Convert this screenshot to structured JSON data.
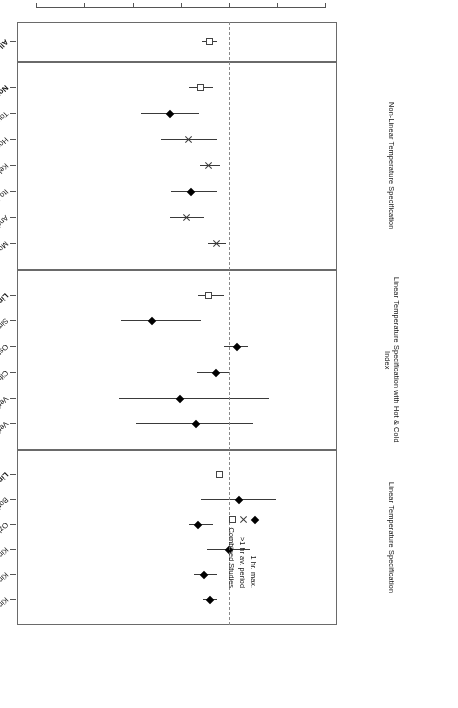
{
  "chart_data": {
    "type": "scatter",
    "plot_kind": "forest-plot",
    "title": "",
    "xlabel": "Relative Risk",
    "ylabel": "",
    "xlim": [
      0.78,
      1.44
    ],
    "xticks": [
      0.8,
      0.9,
      1.0,
      1.1,
      1.2,
      1.3,
      1.4
    ],
    "xticklabels": [
      "0.8",
      "0.9",
      "1.0",
      "1.1",
      "1.2",
      "1.3",
      "1.4"
    ],
    "null_reference": 1.0,
    "grid": false,
    "rotated_180": true,
    "legend": {
      "position": "lower-right-inside",
      "entries": [
        {
          "label": "1 hr. max.",
          "symbol": "filled-diamond"
        },
        {
          "label": ">1 hr av. period",
          "symbol": "cross"
        },
        {
          "label": "Combined Studies",
          "symbol": "open-square"
        }
      ]
    },
    "panels": [
      {
        "name": "overall",
        "label": "",
        "rows": [
          {
            "study": "All Studies Combined",
            "bold": true,
            "symbol": "open-square",
            "rr": 1.043,
            "lo": 1.028,
            "hi": 1.058
          }
        ]
      },
      {
        "name": "non-linear-temperature",
        "label": "Non-Linear Temperature Specification",
        "rows": [
          {
            "study": "Non-Linear Temperature Models Combined",
            "bold": true,
            "symbol": "open-square",
            "rr": 1.062,
            "lo": 1.036,
            "hi": 1.085
          },
          {
            "study": "Touloumi et al., 1997",
            "bold": false,
            "symbol": "filled-diamond",
            "rr": 1.124,
            "lo": 1.064,
            "hi": 1.184
          },
          {
            "study": "Hoek et al., 1997",
            "bold": false,
            "symbol": "cross",
            "rr": 1.086,
            "lo": 1.027,
            "hi": 1.144
          },
          {
            "study": "Kelsall et al., 1997",
            "bold": false,
            "symbol": "cross",
            "rr": 1.044,
            "lo": 1.02,
            "hi": 1.062
          },
          {
            "study": "Ito & Thurston, 1996",
            "bold": false,
            "symbol": "filled-diamond",
            "rr": 1.08,
            "lo": 1.026,
            "hi": 1.122
          },
          {
            "study": "Anderson et al., 1996",
            "bold": false,
            "symbol": "cross",
            "rr": 1.09,
            "lo": 1.054,
            "hi": 1.124
          },
          {
            "study": "Moolgavkar et al., 1995",
            "bold": false,
            "symbol": "cross",
            "rr": 1.028,
            "lo": 1.008,
            "hi": 1.046
          }
        ]
      },
      {
        "name": "linear-temperature-hot-cold",
        "label": "Linear Temperature Specification with Hot & Cold Index",
        "rows": [
          {
            "study": "Linear Temperature plus Index Models Combined",
            "bold": true,
            "symbol": "open-square",
            "rr": 1.044,
            "lo": 1.012,
            "hi": 1.066
          },
          {
            "study": "Simpson et al., 1997",
            "bold": false,
            "symbol": "filled-diamond",
            "rr": 1.162,
            "lo": 1.06,
            "hi": 1.226
          },
          {
            "study": "Ostro et al., 1996",
            "bold": false,
            "symbol": "filled-diamond",
            "rr": 0.986,
            "lo": 0.962,
            "hi": 1.012
          },
          {
            "study": "Cifuentes & Lave, 1997",
            "bold": false,
            "symbol": "filled-diamond",
            "rr": 1.03,
            "lo": 1.0,
            "hi": 1.068
          },
          {
            "study": "Verhoeff et al., 1996",
            "bold": false,
            "symbol": "filled-diamond",
            "rr": 1.104,
            "lo": 0.92,
            "hi": 1.23
          },
          {
            "study": "Verhoeff et al., 1996",
            "bold": false,
            "symbol": "filled-diamond",
            "rr": 1.07,
            "lo": 0.952,
            "hi": 1.196
          }
        ]
      },
      {
        "name": "linear-temperature",
        "label": "Linear Temperature Specification",
        "rows": [
          {
            "study": "Linear Temperature Models Combined",
            "bold": true,
            "symbol": "open-square",
            "rr": 1.022,
            "lo": 1.016,
            "hi": 1.03
          },
          {
            "study": "Borja-Aburto et al., 1997",
            "bold": false,
            "symbol": "filled-diamond",
            "rr": 0.982,
            "lo": 0.904,
            "hi": 1.06
          },
          {
            "study": "Ozkaynak et al., 1995",
            "bold": false,
            "symbol": "filled-diamond",
            "rr": 1.066,
            "lo": 1.036,
            "hi": 1.086
          },
          {
            "study": "Kinney et al., 1995",
            "bold": false,
            "symbol": "filled-diamond",
            "rr": 1.002,
            "lo": 0.958,
            "hi": 1.048
          },
          {
            "study": "Kinney & Ozkaynak, 1992",
            "bold": false,
            "symbol": "filled-diamond",
            "rr": 1.054,
            "lo": 1.026,
            "hi": 1.074
          },
          {
            "study": "Kinney & Ozkaynak, 1991",
            "bold": false,
            "symbol": "filled-diamond",
            "rr": 1.042,
            "lo": 1.028,
            "hi": 1.056
          }
        ]
      }
    ]
  },
  "axis": {
    "title": "Relative Risk",
    "ticklabels": [
      "1.4",
      "1.3",
      "1.2",
      "1.1",
      "1.0",
      "0.9",
      "0.8"
    ]
  },
  "panel_labels": {
    "p0": "",
    "p1": "Non-Linear Temperature Specification",
    "p2": "Linear Temperature Specification with Hot & Cold Index",
    "p3": "Linear Temperature Specification"
  },
  "legend": {
    "item1": "1 hr. max.",
    "item2": ">1 hr av. period",
    "item3": "Combined Studies"
  },
  "colors": {
    "marker": "#000000",
    "ci_line": "#3a3a3a",
    "frame": "#6a6a6a",
    "null_line": "#8a8a8a",
    "text": "#111111"
  }
}
